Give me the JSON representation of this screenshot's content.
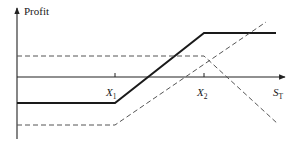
{
  "chart_data": {
    "type": "line",
    "title": "",
    "ylabel": "Profit",
    "xlabel": "S_T",
    "xlabel_display": {
      "main": "S",
      "sub": "T"
    },
    "tick_labels": [
      {
        "main": "X",
        "sub": "1"
      },
      {
        "main": "X",
        "sub": "2"
      }
    ],
    "grid": false,
    "legend": null,
    "colors": {
      "axis": "#222222",
      "solid": "#1a1a1a",
      "dashed": "#555555"
    },
    "series": [
      {
        "name": "bull-spread-profit",
        "style": "solid",
        "points_px": [
          [
            17,
            103
          ],
          [
            115,
            103
          ],
          [
            204,
            33
          ],
          [
            276,
            33
          ]
        ]
      },
      {
        "name": "short-put-profit",
        "style": "dashed",
        "points_px": [
          [
            17,
            56
          ],
          [
            204,
            56
          ],
          [
            278,
            124
          ]
        ]
      },
      {
        "name": "long-put-profit",
        "style": "dashed",
        "points_px": [
          [
            17,
            125
          ],
          [
            115,
            125
          ],
          [
            266,
            22
          ]
        ]
      }
    ],
    "axes_px": {
      "y_axis": {
        "x": 17,
        "y_top": 8,
        "y_bottom": 139
      },
      "x_axis": {
        "y": 77,
        "x_left": 17,
        "x_right": 285
      },
      "ticks": [
        {
          "x": 115
        },
        {
          "x": 204
        }
      ]
    }
  }
}
